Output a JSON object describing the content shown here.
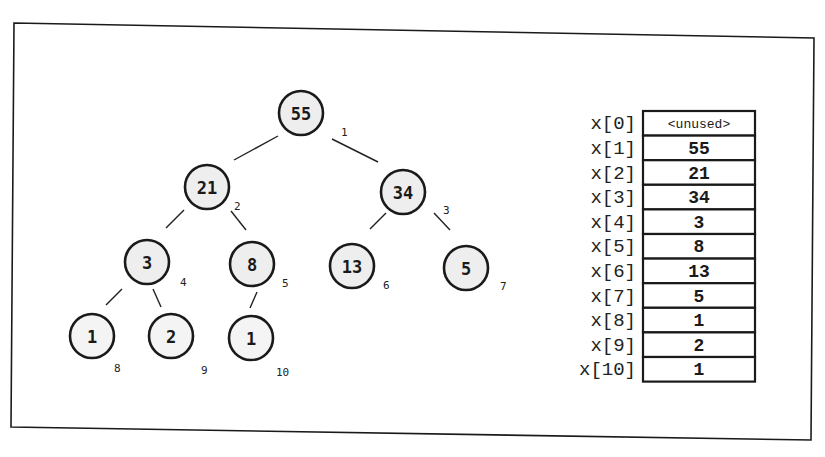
{
  "diagram": {
    "tree": {
      "nodes": [
        {
          "index": "1",
          "value": "55",
          "cx": 301,
          "cy": 113
        },
        {
          "index": "2",
          "value": "21",
          "cx": 207,
          "cy": 187
        },
        {
          "index": "3",
          "value": "34",
          "cx": 403,
          "cy": 192
        },
        {
          "index": "4",
          "value": "3",
          "cx": 147,
          "cy": 262
        },
        {
          "index": "5",
          "value": "8",
          "cx": 252,
          "cy": 264
        },
        {
          "index": "6",
          "value": "13",
          "cx": 352,
          "cy": 266
        },
        {
          "index": "7",
          "value": "5",
          "cx": 466,
          "cy": 268
        },
        {
          "index": "8",
          "value": "1",
          "cx": 92,
          "cy": 336
        },
        {
          "index": "9",
          "value": "2",
          "cx": 171,
          "cy": 336
        },
        {
          "index": "10",
          "value": "1",
          "cx": 251,
          "cy": 338
        }
      ],
      "edges": [
        {
          "from": "1",
          "to": "2",
          "x1": 278,
          "y1": 136,
          "x2": 234,
          "y2": 160
        },
        {
          "from": "1",
          "to": "3",
          "x1": 332,
          "y1": 139,
          "x2": 378,
          "y2": 162
        },
        {
          "from": "2",
          "to": "4",
          "x1": 184,
          "y1": 210,
          "x2": 166,
          "y2": 228
        },
        {
          "from": "2",
          "to": "5",
          "x1": 231,
          "y1": 211,
          "x2": 246,
          "y2": 230
        },
        {
          "from": "3",
          "to": "6",
          "x1": 386,
          "y1": 213,
          "x2": 370,
          "y2": 229
        },
        {
          "from": "3",
          "to": "7",
          "x1": 434,
          "y1": 213,
          "x2": 450,
          "y2": 230
        },
        {
          "from": "4",
          "to": "8",
          "x1": 122,
          "y1": 289,
          "x2": 106,
          "y2": 305
        },
        {
          "from": "4",
          "to": "9",
          "x1": 153,
          "y1": 289,
          "x2": 161,
          "y2": 307
        },
        {
          "from": "5",
          "to": "10",
          "x1": 257,
          "y1": 292,
          "x2": 250,
          "y2": 308
        }
      ],
      "index_labels": [
        {
          "text": "1",
          "x": 341,
          "y": 136
        },
        {
          "text": "2",
          "x": 234,
          "y": 210
        },
        {
          "text": "3",
          "x": 443,
          "y": 214
        },
        {
          "text": "4",
          "x": 180,
          "y": 286
        },
        {
          "text": "5",
          "x": 282,
          "y": 287
        },
        {
          "text": "6",
          "x": 383,
          "y": 289
        },
        {
          "text": "7",
          "x": 500,
          "y": 290
        },
        {
          "text": "8",
          "x": 114,
          "y": 372
        },
        {
          "text": "9",
          "x": 201,
          "y": 374
        },
        {
          "text": "10",
          "x": 276,
          "y": 376
        }
      ]
    },
    "array": {
      "name": "x",
      "rows": [
        {
          "label": "x[0]",
          "value": "<unused>"
        },
        {
          "label": "x[1]",
          "value": "55"
        },
        {
          "label": "x[2]",
          "value": "21"
        },
        {
          "label": "x[3]",
          "value": "34"
        },
        {
          "label": "x[4]",
          "value": "3"
        },
        {
          "label": "x[5]",
          "value": "8"
        },
        {
          "label": "x[6]",
          "value": "13"
        },
        {
          "label": "x[7]",
          "value": "5"
        },
        {
          "label": "x[8]",
          "value": "1"
        },
        {
          "label": "x[9]",
          "value": "2"
        },
        {
          "label": "x[10]",
          "value": "1"
        }
      ]
    },
    "colors": {
      "stroke": "#1a1a1a",
      "node_fill": "#eeeeee",
      "background": "#ffffff"
    }
  }
}
